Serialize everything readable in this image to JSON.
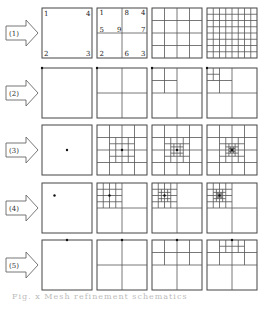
{
  "layout": {
    "columns_x": [
      42,
      97,
      152,
      207
    ],
    "rows_y": [
      8,
      68,
      125,
      183,
      240
    ],
    "box_size": 50
  },
  "rows": [
    {
      "label": "(1)",
      "panels": [
        {
          "type": "uniform",
          "n": 1,
          "corner_labels": {
            "tl": "1",
            "tr": "4",
            "bl": "2",
            "br": "3"
          }
        },
        {
          "type": "uniform",
          "n": 2,
          "labels": [
            {
              "text": "1",
              "fx": 0.05,
              "fy": 0.14
            },
            {
              "text": "8",
              "fx": 0.55,
              "fy": 0.14
            },
            {
              "text": "4",
              "fx": 0.88,
              "fy": 0.14
            },
            {
              "text": "5",
              "fx": 0.05,
              "fy": 0.47
            },
            {
              "text": "9",
              "fx": 0.4,
              "fy": 0.47
            },
            {
              "text": "7",
              "fx": 0.88,
              "fy": 0.47
            },
            {
              "text": "2",
              "fx": 0.05,
              "fy": 0.95
            },
            {
              "text": "6",
              "fx": 0.55,
              "fy": 0.95
            },
            {
              "text": "3",
              "fx": 0.88,
              "fy": 0.95
            }
          ]
        },
        {
          "type": "uniform",
          "n": 4
        },
        {
          "type": "uniform",
          "n": 8
        }
      ]
    },
    {
      "label": "(2)",
      "point": [
        0.0,
        0.0
      ],
      "panels": [
        {
          "type": "adaptive",
          "levels": 0
        },
        {
          "type": "adaptive",
          "levels": 1
        },
        {
          "type": "adaptive",
          "levels": 2
        },
        {
          "type": "adaptive",
          "levels": 3
        }
      ]
    },
    {
      "label": "(3)",
      "point": [
        0.5,
        0.5
      ],
      "panels": [
        {
          "type": "adaptive",
          "levels": 0
        },
        {
          "type": "adaptive",
          "levels": 3
        },
        {
          "type": "adaptive",
          "levels": 4
        },
        {
          "type": "adaptive",
          "levels": 5
        }
      ]
    },
    {
      "label": "(4)",
      "point": [
        0.25,
        0.25
      ],
      "panels": [
        {
          "type": "adaptive",
          "levels": 0
        },
        {
          "type": "adaptive",
          "levels": 3
        },
        {
          "type": "adaptive",
          "levels": 4
        },
        {
          "type": "adaptive",
          "levels": 5
        }
      ]
    },
    {
      "label": "(5)",
      "point": [
        0.5,
        0.0
      ],
      "panels": [
        {
          "type": "adaptive",
          "levels": 0
        },
        {
          "type": "adaptive",
          "levels": 1
        },
        {
          "type": "adaptive",
          "levels": 2
        },
        {
          "type": "adaptive",
          "levels": 3
        }
      ]
    }
  ],
  "caption": "Fig. x  Mesh refinement schematics"
}
